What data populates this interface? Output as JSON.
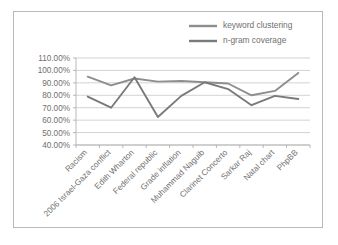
{
  "chart_data": {
    "type": "line",
    "title": "",
    "xlabel": "",
    "ylabel": "",
    "grid": true,
    "legend_position": "top-right",
    "ylim": [
      40,
      110
    ],
    "ytick_labels": [
      "110.00%",
      "100.00%",
      "90.00%",
      "80.00%",
      "70.00%",
      "60.00%",
      "50.00%",
      "40.00%"
    ],
    "ytick_values": [
      110,
      100,
      90,
      80,
      70,
      60,
      50,
      40
    ],
    "categories": [
      "Racism",
      "2006 Israel-Gaza conflict",
      "Edith Wharton",
      "Federal republic",
      "Grade inflation",
      "Muhammad Naguib",
      "Clarinet Concerto",
      "Sarkar Raj",
      "Natal chart",
      "PhpBB"
    ],
    "series": [
      {
        "name": "keyword clustering",
        "color": "#8e8e8e",
        "values": [
          95.0,
          88.0,
          93.5,
          91.0,
          91.5,
          90.5,
          89.5,
          80.0,
          83.5,
          98.0
        ]
      },
      {
        "name": "n-gram coverage",
        "color": "#7a7a7a",
        "values": [
          79.0,
          70.0,
          94.5,
          62.5,
          79.5,
          90.5,
          85.0,
          72.0,
          79.5,
          77.0
        ]
      }
    ]
  },
  "legend": {
    "items": [
      {
        "label": "keyword clustering"
      },
      {
        "label": "n-gram coverage"
      }
    ]
  },
  "colors": {
    "series_1": "#8e8e8e",
    "series_2": "#7a7a7a",
    "gridline": "#bfbfbf",
    "axis": "#a8a8a8",
    "text": "#6f6f6f",
    "frame_border": "#b9b9b9",
    "background": "#ffffff"
  }
}
